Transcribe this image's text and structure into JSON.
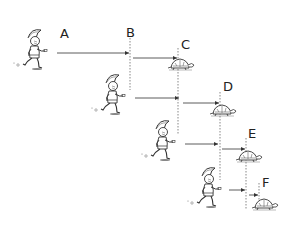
{
  "labels": {
    "A": "A",
    "B": "B",
    "C": "C",
    "D": "D",
    "E": "E",
    "F": "F"
  },
  "rows": [
    {
      "runner_label": "A",
      "runner_at": "A",
      "reach": "B",
      "tortoise_at": "C"
    },
    {
      "runner_at": "B",
      "reach": "C",
      "tortoise_at": "D"
    },
    {
      "runner_at": "C",
      "reach": "D",
      "tortoise_at": "E"
    },
    {
      "runner_at": "D",
      "reach": "E",
      "tortoise_at": "F"
    }
  ],
  "colors": {
    "ink": "#333333",
    "background": "#ffffff"
  }
}
